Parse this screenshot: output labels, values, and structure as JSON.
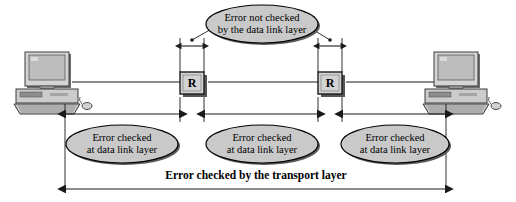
{
  "diagram": {
    "title_caption": "Error checked by the transport layer",
    "colors": {
      "background": "#ffffff",
      "line": "#1a1a1a",
      "ellipse_fill": "#c9c9c9",
      "ellipse_stroke": "#000000",
      "shadow": "#4a4a4a",
      "device_light": "#d8d8d8",
      "device_mid": "#b4b4b4",
      "device_dark": "#7d7d7d",
      "screen": "#c0c0c0"
    },
    "nodes": {
      "left_host": {
        "name": "workstation",
        "label": ""
      },
      "right_host": {
        "name": "workstation",
        "label": ""
      },
      "router_left": {
        "label": "R"
      },
      "router_right": {
        "label": "R"
      }
    },
    "callouts": [
      {
        "id": "top",
        "line1": "Error not checked",
        "line2": "by the data link layer"
      },
      {
        "id": "left",
        "line1": "Error checked",
        "line2": "at data link layer"
      },
      {
        "id": "middle",
        "line1": "Error checked",
        "line2": "at data link layer"
      },
      {
        "id": "right",
        "line1": "Error checked",
        "line2": "at data link layer"
      }
    ],
    "spans": [
      {
        "id": "segment-1",
        "label": ""
      },
      {
        "id": "segment-2",
        "label": ""
      },
      {
        "id": "segment-3",
        "label": ""
      },
      {
        "id": "router-left-internal",
        "label": ""
      },
      {
        "id": "router-right-internal",
        "label": ""
      }
    ]
  }
}
